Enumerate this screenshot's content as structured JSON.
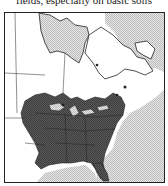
{
  "caption": {
    "text": "fields, especially on basic soils"
  },
  "map": {
    "region": "Eastern North America",
    "type": "species range map",
    "legend": [],
    "colors": {
      "range": "#555555",
      "water": "#cfcfcf",
      "land": "#ffffff",
      "border": "#222222"
    }
  }
}
